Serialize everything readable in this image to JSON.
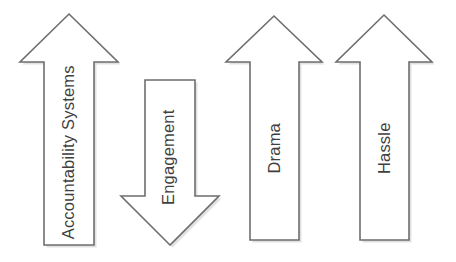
{
  "diagram": {
    "background_color": "#ffffff",
    "stroke_color": "#6e6e6e",
    "fill_color": "#ffffff",
    "label_color": "#3f3f3f",
    "shadow_color": "#c9c9c9"
  },
  "arrows": [
    {
      "id": "accountability-systems",
      "label": "Accountability Systems",
      "direction": "up",
      "points": "69,14 118,62 94,62 94,245 44,245 44,62 20,62",
      "label_center_x": 68,
      "label_center_y": 152,
      "label_width": 190,
      "label_height": 22
    },
    {
      "id": "engagement",
      "label": "Engagement",
      "direction": "down",
      "points": "170,245 121,196 145,196 145,80 195,80 195,196 219,196",
      "label_center_x": 168,
      "label_center_y": 157,
      "label_width": 132,
      "label_height": 22
    },
    {
      "id": "drama",
      "label": "Drama",
      "direction": "up",
      "points": "274,16 322,62 299,62 299,240 250,240 250,62 226,62",
      "label_center_x": 274,
      "label_center_y": 148,
      "label_width": 74,
      "label_height": 22
    },
    {
      "id": "hassle",
      "label": "Hassle",
      "direction": "up",
      "points": "384,15 432,62 409,62 409,240 360,240 360,62 336,62",
      "label_center_x": 384,
      "label_center_y": 148,
      "label_width": 70,
      "label_height": 22
    }
  ]
}
